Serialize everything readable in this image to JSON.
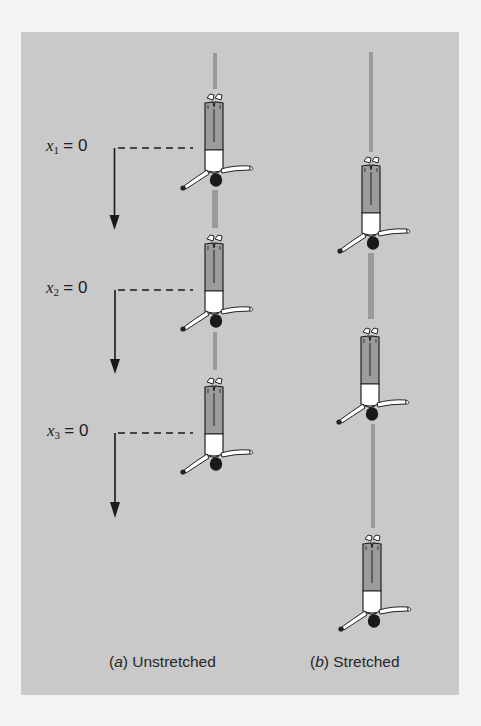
{
  "figure": {
    "background_color": "#c9c9c9",
    "page_color": "#f3f3f3",
    "cord_color": "#9a9a9a",
    "arrow_color": "#1a1a1a",
    "panels": [
      {
        "id": "a",
        "caption_letter": "a",
        "caption_text": "Unstretched",
        "state": "unstretched",
        "jumpers": 3,
        "markers": [
          {
            "var": "x",
            "sub": "1",
            "eq": "= 0"
          },
          {
            "var": "x",
            "sub": "2",
            "eq": "= 0"
          },
          {
            "var": "x",
            "sub": "3",
            "eq": "= 0"
          }
        ]
      },
      {
        "id": "b",
        "caption_letter": "b",
        "caption_text": "Stretched",
        "state": "stretched",
        "jumpers": 3
      }
    ]
  }
}
